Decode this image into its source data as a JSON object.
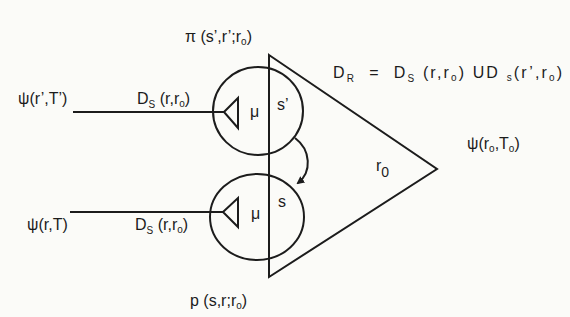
{
  "diagram": {
    "colors": {
      "ink": "#1c1c1c",
      "paper": "#fbfbf8"
    },
    "labels": {
      "top_joint": {
        "a": "π (s’,r’;r",
        "sub": "o",
        "b": ")"
      },
      "bottom_joint": {
        "a": "p (s,r;r",
        "sub": "o",
        "b": ")"
      },
      "upper_input": "ψ(r’,T’)",
      "lower_input": "ψ(r,T)",
      "upper_ds": {
        "a": "D",
        "sub1": "S",
        "b": " (r,r",
        "sub2": "o",
        "c": ")"
      },
      "lower_ds": {
        "a": "D",
        "sub1": "S",
        "b": " (r,r",
        "sub2": "o",
        "c": ")"
      },
      "equation": {
        "lhs": "D",
        "lhs_sub": "R",
        "eq": "  =  ",
        "d1": "D",
        "d1_sub": "S",
        "d1_args_a": " (r,r",
        "d1_args_sub": "o",
        "d1_args_b": ")",
        "union": " UD ",
        "d2_sub": "s",
        "d2_args_a": "(r’,r",
        "d2_args_sub": "o",
        "d2_args_b": ")"
      },
      "output": {
        "a": "ψ(r",
        "sub1": "o",
        "b": ",T",
        "sub2": "o",
        "c": ")"
      },
      "triangle": {
        "r": "r",
        "sub": "0"
      },
      "upper_neuron": {
        "mu": "μ",
        "state": "s’"
      },
      "lower_neuron": {
        "mu": "μ",
        "state": "s"
      }
    }
  }
}
